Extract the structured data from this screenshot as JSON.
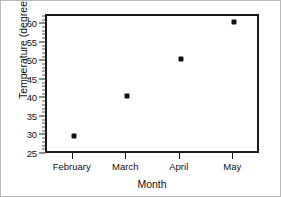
{
  "chart_data": {
    "type": "scatter",
    "title": "",
    "xlabel": "Month",
    "ylabel": "Temperature (degrees F)",
    "categories": [
      "February",
      "March",
      "April",
      "May"
    ],
    "values": [
      30,
      41,
      51,
      61
    ],
    "points": [
      {
        "category": "February",
        "value": 30
      },
      {
        "category": "March",
        "value": 41
      },
      {
        "category": "April",
        "value": 51
      },
      {
        "category": "May",
        "value": 61
      }
    ],
    "ylim": [
      25,
      62.5
    ],
    "yticks": [
      25,
      30,
      35,
      40,
      45,
      50,
      55,
      60
    ],
    "ytick_labels": [
      "25",
      "30",
      "35",
      "40",
      "45",
      "50",
      "55",
      "60"
    ],
    "y_minor_tick_step": 1,
    "grid": false,
    "legend": false,
    "legend_position": "none",
    "marker": "filled-square",
    "marker_color": "#111111",
    "axis_color": "#1a1a1a",
    "background_color": "#ffffff"
  }
}
